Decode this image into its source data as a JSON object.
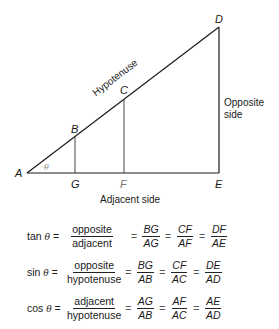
{
  "diagram": {
    "points": {
      "A": {
        "label": "A",
        "x": 27,
        "y": 173
      },
      "B": {
        "label": "B",
        "x": 75,
        "y": 137
      },
      "C": {
        "label": "C",
        "x": 124,
        "y": 99
      },
      "D": {
        "label": "D",
        "x": 219,
        "y": 27
      },
      "E": {
        "label": "E",
        "x": 219,
        "y": 173
      },
      "F": {
        "label": "F",
        "x": 124,
        "y": 173
      },
      "G": {
        "label": "G",
        "x": 75,
        "y": 173
      }
    },
    "angle_label": "θ",
    "hypotenuse_label": "Hypotenuse",
    "opposite_label_line1": "Opposite",
    "opposite_label_line2": "side",
    "adjacent_label": "Adjacent side",
    "line_color": "#1a1a1a",
    "inner_line_color": "#444444"
  },
  "formulas": [
    {
      "name": "tan",
      "theta": "θ",
      "ratio": {
        "num": "opposite",
        "den": "adjacent"
      },
      "fractions": [
        {
          "num": "BG",
          "den": "AG"
        },
        {
          "num": "CF",
          "den": "AF"
        },
        {
          "num": "DF",
          "den": "AE"
        }
      ]
    },
    {
      "name": "sin",
      "theta": "θ",
      "ratio": {
        "num": "opposite",
        "den": "hypotenuse"
      },
      "fractions": [
        {
          "num": "BG",
          "den": "AB"
        },
        {
          "num": "CF",
          "den": "AC"
        },
        {
          "num": "DE",
          "den": "AD"
        }
      ]
    },
    {
      "name": "cos",
      "theta": "θ",
      "ratio": {
        "num": "adjacent",
        "den": "hypotenuse"
      },
      "fractions": [
        {
          "num": "AG",
          "den": "AB"
        },
        {
          "num": "AF",
          "den": "AC"
        },
        {
          "num": "AE",
          "den": "AD"
        }
      ]
    }
  ],
  "symbols": {
    "equals": "="
  }
}
